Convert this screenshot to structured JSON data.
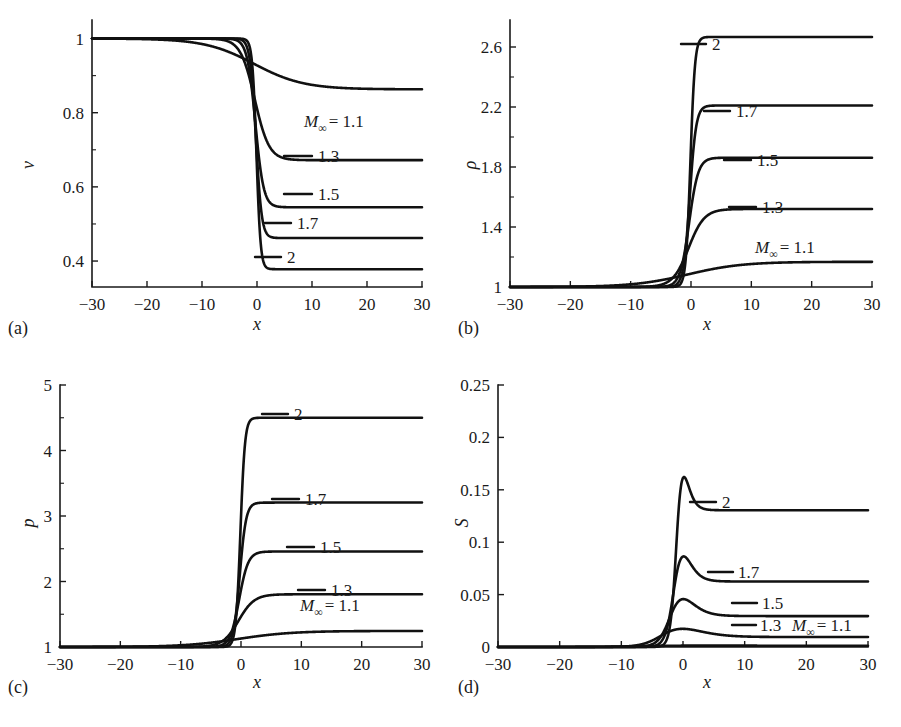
{
  "figure": {
    "background": "#ffffff",
    "curve_color": "#111111",
    "axis_color": "#1a1a1a"
  },
  "panels": [
    {
      "id": "a",
      "label": "(a)",
      "ylabel": "v",
      "xlabel": "x",
      "xticks": [
        "-30",
        "-20",
        "-10",
        "0",
        "10",
        "20",
        "30"
      ],
      "yticks": [
        "0.4",
        "0.6",
        "0.8",
        "1"
      ],
      "mach_label": "M",
      "mach_sub": "∞",
      "mach_eq": "= 1.1"
    },
    {
      "id": "b",
      "label": "(b)",
      "ylabel": "ρ",
      "xlabel": "x",
      "xticks": [
        "-30",
        "-20",
        "-10",
        "0",
        "10",
        "20",
        "30"
      ],
      "yticks": [
        "1",
        "1.4",
        "1.8",
        "2.2",
        "2.6"
      ],
      "mach_label": "M",
      "mach_sub": "∞",
      "mach_eq": "= 1.1"
    },
    {
      "id": "c",
      "label": "(c)",
      "ylabel": "p",
      "xlabel": "x",
      "xticks": [
        "-30",
        "-20",
        "-10",
        "0",
        "10",
        "20",
        "30"
      ],
      "yticks": [
        "1",
        "2",
        "3",
        "4",
        "5"
      ],
      "mach_label": "M",
      "mach_sub": "∞",
      "mach_eq": "= 1.1"
    },
    {
      "id": "d",
      "label": "(d)",
      "ylabel": "S",
      "xlabel": "x",
      "xticks": [
        "-30",
        "-20",
        "-10",
        "0",
        "10",
        "20",
        "30"
      ],
      "yticks": [
        "0",
        "0.05",
        "0.1",
        "0.15",
        "0.2",
        "0.25"
      ],
      "mach_label": "M",
      "mach_sub": "∞",
      "mach_eq": "= 1.1"
    }
  ],
  "curve_labels": {
    "m2": "2",
    "m17": "1.7",
    "m15": "1.5",
    "m13": "1.3"
  },
  "chart_data": [
    {
      "type": "line",
      "panel": "a",
      "title": "",
      "xlabel": "x",
      "ylabel": "v",
      "xlim": [
        -30,
        30
      ],
      "ylim": [
        0.33,
        1.05
      ],
      "xticks": [
        -30,
        -20,
        -10,
        0,
        10,
        20,
        30
      ],
      "yticks": [
        0.4,
        0.6,
        0.8,
        1
      ],
      "minor_yticks": [
        0.5,
        0.7,
        0.9
      ],
      "grid": false,
      "legend": "inline-labels",
      "series": [
        {
          "name": "M_inf = 1.1",
          "upstream": 1.0,
          "downstream": 0.863,
          "shock_center": -0.5,
          "width": 9.0,
          "label": "M∞ = 1.1"
        },
        {
          "name": "1.3",
          "upstream": 1.0,
          "downstream": 0.672,
          "shock_center": -0.4,
          "width": 2.6,
          "label": "1.3"
        },
        {
          "name": "1.5",
          "upstream": 1.0,
          "downstream": 0.545,
          "shock_center": -0.3,
          "width": 1.5,
          "label": "1.5"
        },
        {
          "name": "1.7",
          "upstream": 1.0,
          "downstream": 0.462,
          "shock_center": -0.2,
          "width": 1.05,
          "label": "1.7"
        },
        {
          "name": "2",
          "upstream": 1.0,
          "downstream": 0.378,
          "shock_center": -0.1,
          "width": 0.75,
          "label": "2"
        }
      ]
    },
    {
      "type": "line",
      "panel": "b",
      "title": "",
      "xlabel": "x",
      "ylabel": "ρ",
      "xlim": [
        -30,
        30
      ],
      "ylim": [
        1.0,
        2.78
      ],
      "xticks": [
        -30,
        -20,
        -10,
        0,
        10,
        20,
        30
      ],
      "yticks": [
        1,
        1.4,
        1.8,
        2.2,
        2.6
      ],
      "minor_yticks": [
        1.2,
        1.6,
        2.0,
        2.4
      ],
      "grid": false,
      "legend": "inline-labels",
      "series": [
        {
          "name": "M_inf = 1.1",
          "upstream": 1.0,
          "downstream": 1.168,
          "shock_center": -0.5,
          "width": 9.0,
          "label": "M∞ = 1.1"
        },
        {
          "name": "1.3",
          "upstream": 1.0,
          "downstream": 1.52,
          "shock_center": -0.4,
          "width": 2.6,
          "label": "1.3"
        },
        {
          "name": "1.5",
          "upstream": 1.0,
          "downstream": 1.862,
          "shock_center": -0.3,
          "width": 1.5,
          "label": "1.5"
        },
        {
          "name": "1.7",
          "upstream": 1.0,
          "downstream": 2.21,
          "shock_center": -0.2,
          "width": 1.05,
          "label": "1.7"
        },
        {
          "name": "2",
          "upstream": 1.0,
          "downstream": 2.667,
          "shock_center": -0.1,
          "width": 0.75,
          "label": "2"
        }
      ]
    },
    {
      "type": "line",
      "panel": "c",
      "title": "",
      "xlabel": "x",
      "ylabel": "p",
      "xlim": [
        -30,
        30
      ],
      "ylim": [
        1.0,
        5.0
      ],
      "xticks": [
        -30,
        -20,
        -10,
        0,
        10,
        20,
        30
      ],
      "yticks": [
        1,
        2,
        3,
        4,
        5
      ],
      "minor_yticks": [
        1.5,
        2.5,
        3.5,
        4.5
      ],
      "grid": false,
      "legend": "inline-labels",
      "series": [
        {
          "name": "M_inf = 1.1",
          "upstream": 1.0,
          "downstream": 1.245,
          "shock_center": -0.5,
          "width": 9.0,
          "label": "M∞ = 1.1"
        },
        {
          "name": "1.3",
          "upstream": 1.0,
          "downstream": 1.805,
          "shock_center": -0.4,
          "width": 2.6,
          "label": "1.3"
        },
        {
          "name": "1.5",
          "upstream": 1.0,
          "downstream": 2.458,
          "shock_center": -0.3,
          "width": 1.5,
          "label": "1.5"
        },
        {
          "name": "1.7",
          "upstream": 1.0,
          "downstream": 3.205,
          "shock_center": -0.2,
          "width": 1.05,
          "label": "1.7"
        },
        {
          "name": "2",
          "upstream": 1.0,
          "downstream": 4.5,
          "shock_center": -0.1,
          "width": 0.75,
          "label": "2"
        }
      ]
    },
    {
      "type": "line",
      "panel": "d",
      "title": "",
      "xlabel": "x",
      "ylabel": "S",
      "xlim": [
        -30,
        30
      ],
      "ylim": [
        0,
        0.25
      ],
      "xticks": [
        -30,
        -20,
        -10,
        0,
        10,
        20,
        30
      ],
      "yticks": [
        0,
        0.05,
        0.1,
        0.15,
        0.2,
        0.25
      ],
      "grid": false,
      "legend": "inline-labels",
      "series": [
        {
          "name": "M_inf = 1.1",
          "peak": 0.0016,
          "plateau": 0.0012,
          "peak_x": -0.5,
          "width": 7.0,
          "label": "M∞ = 1.1"
        },
        {
          "name": "1.3",
          "peak": 0.0255,
          "plateau": 0.0095,
          "peak_x": -0.4,
          "width": 3.2,
          "label": "1.3"
        },
        {
          "name": "1.5",
          "peak": 0.0645,
          "plateau": 0.0295,
          "peak_x": -0.3,
          "width": 1.9,
          "label": "1.5"
        },
        {
          "name": "1.7",
          "peak": 0.1175,
          "plateau": 0.0625,
          "peak_x": -0.25,
          "width": 1.35,
          "label": "1.7"
        },
        {
          "name": "2",
          "peak": 0.2105,
          "plateau": 0.1305,
          "peak_x": -0.2,
          "width": 0.95,
          "label": "2"
        }
      ]
    }
  ]
}
